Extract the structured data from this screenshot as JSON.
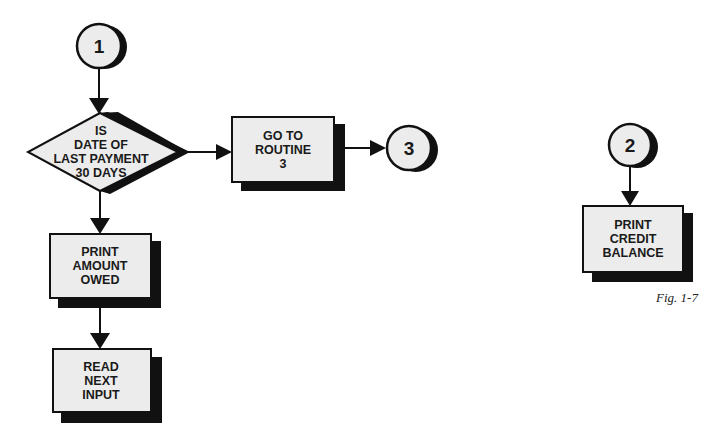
{
  "diagram": {
    "type": "flowchart",
    "colors": {
      "fill": "#ececec",
      "stroke": "#111111",
      "shadow": "#111111",
      "background": "#ffffff"
    },
    "connectors": {
      "c1": {
        "label": "1"
      },
      "c2": {
        "label": "2"
      },
      "c3": {
        "label": "3"
      }
    },
    "decision": {
      "lines": [
        "IS",
        "DATE OF",
        "LAST PAYMENT",
        "30 DAYS"
      ]
    },
    "boxes": {
      "goto_routine": {
        "lines": [
          "GO TO",
          "ROUTINE",
          "3"
        ]
      },
      "print_amount": {
        "lines": [
          "PRINT",
          "AMOUNT",
          "OWED"
        ]
      },
      "read_next": {
        "lines": [
          "READ",
          "NEXT",
          "INPUT"
        ]
      },
      "print_credit": {
        "lines": [
          "PRINT",
          "CREDIT",
          "BALANCE"
        ]
      }
    },
    "edges": [
      {
        "from": "connector-1",
        "to": "decision"
      },
      {
        "from": "decision",
        "to": "goto-routine-box",
        "direction": "right"
      },
      {
        "from": "goto-routine-box",
        "to": "connector-3"
      },
      {
        "from": "decision",
        "to": "print-amount-box",
        "direction": "down"
      },
      {
        "from": "print-amount-box",
        "to": "read-next-box"
      },
      {
        "from": "connector-2",
        "to": "print-credit-box"
      }
    ],
    "caption": "Fig. 1-7"
  }
}
